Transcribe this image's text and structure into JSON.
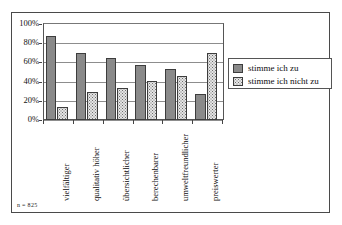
{
  "chart_data": {
    "type": "bar",
    "title": "",
    "xlabel": "",
    "ylabel": "",
    "ylim": [
      0,
      100
    ],
    "ytick_labels": [
      "100%",
      "80%",
      "60%",
      "40%",
      "20%",
      "0%"
    ],
    "ytick_values": [
      100,
      80,
      60,
      40,
      20,
      0
    ],
    "grid": true,
    "legend_position": "right",
    "categories": [
      "vielfältiger",
      "qualitativ höher",
      "übersichtlicher",
      "berechenbarer",
      "umweltfreundlicher",
      "preiswerter"
    ],
    "series": [
      {
        "name": "stimme ich zu",
        "values": [
          87,
          70,
          65,
          57,
          53,
          27
        ]
      },
      {
        "name": "stimme ich nicht zu",
        "values": [
          14,
          29,
          33,
          41,
          46,
          70
        ]
      }
    ]
  },
  "legend": {
    "items": [
      {
        "label": "stimme ich zu"
      },
      {
        "label": "stimme ich nicht zu"
      }
    ]
  },
  "footnote": {
    "text": "n = 825"
  }
}
